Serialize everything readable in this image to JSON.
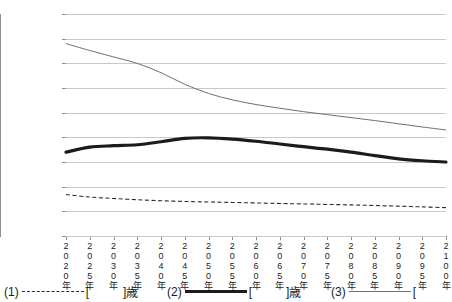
{
  "chart_data": {
    "type": "line",
    "title": "",
    "xlabel": "",
    "ylabel": "",
    "ylim": [
      0,
      9000
    ],
    "ytick_step": 1000,
    "yticks": [
      "9000",
      "8000",
      "7000",
      "6000",
      "5000",
      "4000",
      "3000",
      "2000",
      "1000",
      "0"
    ],
    "grid": true,
    "legend_position": "bottom",
    "categories": [
      "2020年",
      "2025年",
      "2030年",
      "2035年",
      "2040年",
      "2045年",
      "2050年",
      "2055年",
      "2060年",
      "2065年",
      "2070年",
      "2075年",
      "2080年",
      "2085年",
      "2090年",
      "2095年",
      "2100年"
    ],
    "series": [
      {
        "name": "(1)",
        "style": "dashed",
        "color": "#2b2b2b",
        "values": [
          1680,
          1580,
          1520,
          1470,
          1430,
          1400,
          1380,
          1360,
          1340,
          1320,
          1300,
          1280,
          1260,
          1235,
          1210,
          1180,
          1150
        ]
      },
      {
        "name": "(2)",
        "style": "thick",
        "color": "#1b1b1b",
        "values": [
          3400,
          3600,
          3660,
          3700,
          3820,
          3960,
          3980,
          3930,
          3840,
          3730,
          3620,
          3520,
          3400,
          3260,
          3130,
          3050,
          3000
        ]
      },
      {
        "name": "(3)",
        "style": "thin",
        "color": "#6f6f6f",
        "values": [
          7800,
          7520,
          7260,
          7000,
          6620,
          6150,
          5780,
          5520,
          5330,
          5180,
          5040,
          4920,
          4800,
          4680,
          4550,
          4420,
          4300
        ]
      }
    ]
  },
  "legend": {
    "items": [
      {
        "tag": "(1)",
        "swatch": "dashed",
        "bracket_open": "[",
        "bracket_close": "]",
        "unit": "歳"
      },
      {
        "tag": "(2)",
        "swatch": "thick",
        "bracket_open": "[",
        "bracket_close": "]",
        "unit": "歳"
      },
      {
        "tag": "(3)",
        "swatch": "thin",
        "bracket_open": "[",
        "bracket_close": "",
        "unit": ""
      }
    ],
    "item1_tag": "(1)",
    "item1_open": "[",
    "item1_close": "]",
    "item1_unit": "歳",
    "item2_tag": "(2)",
    "item2_open": "[",
    "item2_close": "]",
    "item2_unit": "歳",
    "item3_tag": "(3)",
    "item3_open": "["
  }
}
